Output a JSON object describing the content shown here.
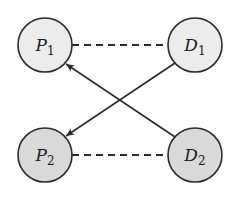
{
  "diagram": {
    "type": "bipartite-graph",
    "colors": {
      "stroke": "#2b2b2b",
      "top_fill": "#ececec",
      "bottom_fill": "#d9d9d9",
      "background": "#ffffff"
    },
    "nodes": [
      {
        "id": "P1",
        "letter": "P",
        "subscript": "1",
        "row": "top",
        "col": "left"
      },
      {
        "id": "D1",
        "letter": "D",
        "subscript": "1",
        "row": "top",
        "col": "right"
      },
      {
        "id": "P2",
        "letter": "P",
        "subscript": "2",
        "row": "bottom",
        "col": "left"
      },
      {
        "id": "D2",
        "letter": "D",
        "subscript": "2",
        "row": "bottom",
        "col": "right"
      }
    ],
    "edges": [
      {
        "from": "P1",
        "to": "D1",
        "style": "dashed",
        "directed": false
      },
      {
        "from": "P2",
        "to": "D2",
        "style": "dashed",
        "directed": false
      },
      {
        "from": "D2",
        "to": "P1",
        "style": "solid",
        "directed": true
      },
      {
        "from": "D1",
        "to": "P2",
        "style": "solid",
        "directed": true
      }
    ]
  }
}
